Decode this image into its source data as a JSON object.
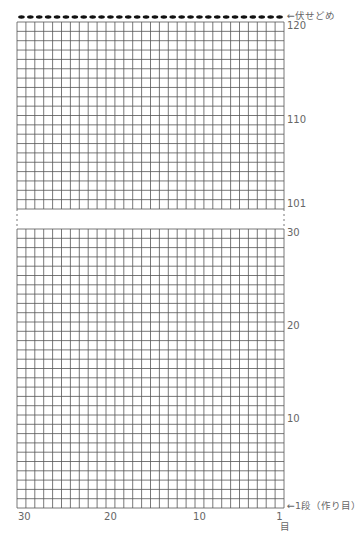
{
  "diagram": {
    "type": "knitting-chart",
    "stitches": 30,
    "upper_section": {
      "row_start": 101,
      "row_end": 120
    },
    "lower_section": {
      "row_start": 1,
      "row_end": 30
    },
    "bind_off_label": "←伏せどめ",
    "cast_on_label": "←1段（作り目）",
    "row_labels": [
      {
        "row": 120,
        "text": "120"
      },
      {
        "row": 110,
        "text": "110"
      },
      {
        "row": 101,
        "text": "101"
      },
      {
        "row": 30,
        "text": "30"
      },
      {
        "row": 20,
        "text": "20"
      },
      {
        "row": 10,
        "text": "10"
      }
    ],
    "column_labels": [
      {
        "col": 30,
        "text": "30"
      },
      {
        "col": 20,
        "text": "20"
      },
      {
        "col": 10,
        "text": "10"
      },
      {
        "col": 1,
        "text": "1"
      }
    ],
    "column_unit": "目",
    "colors": {
      "grid": "#555555",
      "bind_off": "#111111",
      "text": "#666666"
    }
  }
}
